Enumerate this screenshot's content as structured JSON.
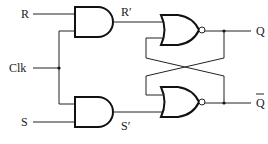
{
  "diagram": {
    "labels": {
      "r_input": "R",
      "clk_input": "Clk",
      "s_input": "S",
      "r_prime": "R′",
      "s_prime": "S′",
      "q_output": "Q",
      "q_bar_output": "Q"
    },
    "components": [
      {
        "id": "and-top",
        "type": "AND",
        "inputs": [
          "R",
          "Clk"
        ],
        "output": "R′"
      },
      {
        "id": "and-bottom",
        "type": "AND",
        "inputs": [
          "Clk",
          "S"
        ],
        "output": "S′"
      },
      {
        "id": "nor-top",
        "type": "NOR",
        "inputs": [
          "R′",
          "Q̄"
        ],
        "output": "Q"
      },
      {
        "id": "nor-bottom",
        "type": "NOR",
        "inputs": [
          "Q",
          "S′"
        ],
        "output": "Q̄"
      }
    ],
    "colors": {
      "line": "#222222",
      "background": "#ffffff"
    }
  }
}
